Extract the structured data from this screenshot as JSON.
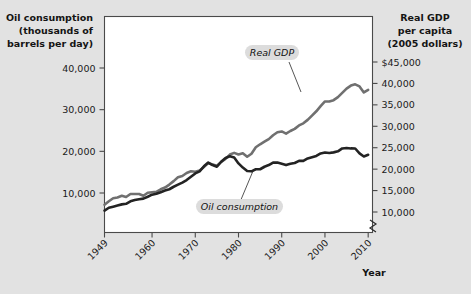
{
  "figure": {
    "background_color": "#e2e2e2",
    "plot_background_color": "#ffffff",
    "frame_color": "#4a4a4a"
  },
  "left_axis": {
    "title_line1": "Oil consumption",
    "title_line2": "(thousands of",
    "title_line3": "barrels per day)",
    "ticks": [
      "40,000",
      "30,000",
      "20,000",
      "10,000"
    ]
  },
  "right_axis": {
    "title_line1": "Real GDP",
    "title_line2": "per capita",
    "title_line3": "(2005 dollars)",
    "ticks": [
      "$45,000",
      "40,000",
      "35,000",
      "30,000",
      "25,000",
      "20,000",
      "15,000",
      "10,000"
    ]
  },
  "x_axis": {
    "title": "Year",
    "ticks": [
      "1949",
      "1960",
      "1970",
      "1980",
      "1990",
      "2000",
      "2010"
    ]
  },
  "labels": {
    "gdp": "Real GDP",
    "oil": "Oil consumption"
  },
  "colors": {
    "gdp_line": "#707070",
    "oil_line": "#232323",
    "label_pill": "#dcdcdc"
  },
  "chart_data": {
    "type": "line",
    "title": "",
    "xlabel": "Year",
    "ylabel_left": "Oil consumption (thousands of barrels per day)",
    "ylabel_right": "Real GDP per capita (2005 dollars)",
    "grid": false,
    "legend_position": "inline-annotations",
    "xlim": [
      1949,
      2011
    ],
    "ylim_left": [
      0,
      45000
    ],
    "ylim_right": [
      7500,
      47500
    ],
    "left_tick_values": [
      40000,
      30000,
      20000,
      10000
    ],
    "right_tick_values": [
      45000,
      40000,
      35000,
      30000,
      25000,
      20000,
      15000,
      10000
    ],
    "x_tick_values": [
      1949,
      1960,
      1970,
      1980,
      1990,
      2000,
      2010
    ],
    "axis_break_right": true,
    "x": [
      1949,
      1950,
      1951,
      1952,
      1953,
      1954,
      1955,
      1956,
      1957,
      1958,
      1959,
      1960,
      1961,
      1962,
      1963,
      1964,
      1965,
      1966,
      1967,
      1968,
      1969,
      1970,
      1971,
      1972,
      1973,
      1974,
      1975,
      1976,
      1977,
      1978,
      1979,
      1980,
      1981,
      1982,
      1983,
      1984,
      1985,
      1986,
      1987,
      1988,
      1989,
      1990,
      1991,
      1992,
      1993,
      1994,
      1995,
      1996,
      1997,
      1998,
      1999,
      2000,
      2001,
      2002,
      2003,
      2004,
      2005,
      2006,
      2007,
      2008,
      2009,
      2010
    ],
    "series": [
      {
        "name": "Oil consumption",
        "axis": "left",
        "units": "thousands of barrels per day",
        "color": "#232323",
        "values": [
          5770,
          6460,
          6720,
          7000,
          7270,
          7400,
          8000,
          8300,
          8500,
          8650,
          9100,
          9600,
          9800,
          10200,
          10600,
          10900,
          11500,
          12000,
          12500,
          13100,
          13900,
          14700,
          15200,
          16400,
          17300,
          16700,
          16300,
          17500,
          18400,
          18800,
          18500,
          17100,
          16100,
          15300,
          15200,
          15700,
          15700,
          16300,
          16700,
          17300,
          17300,
          17000,
          16700,
          17000,
          17200,
          17700,
          17700,
          18300,
          18600,
          18900,
          19500,
          19700,
          19600,
          19750,
          20000,
          20700,
          20800,
          20700,
          20680,
          19500,
          18770,
          19180
        ]
      },
      {
        "name": "Real GDP per capita",
        "axis": "right",
        "units": "2005 dollars",
        "color": "#707070",
        "values": [
          11700,
          12500,
          13200,
          13400,
          13800,
          13500,
          14200,
          14200,
          14200,
          13800,
          14500,
          14600,
          14700,
          15300,
          15700,
          16400,
          17200,
          18100,
          18400,
          19100,
          19500,
          19400,
          19700,
          20500,
          21400,
          21100,
          20800,
          21700,
          22400,
          23400,
          23800,
          23400,
          23700,
          22900,
          23600,
          25100,
          25800,
          26400,
          27000,
          27900,
          28600,
          28800,
          28300,
          28900,
          29400,
          30200,
          30700,
          31500,
          32500,
          33500,
          34700,
          35800,
          35800,
          36100,
          36800,
          37800,
          38800,
          39500,
          39800,
          39300,
          37900,
          38500
        ]
      }
    ],
    "annotations": [
      {
        "text": "Real GDP",
        "x": 1993,
        "y_right": 45500
      },
      {
        "text": "Oil consumption",
        "x": 1989,
        "y_left": 8200
      }
    ]
  }
}
